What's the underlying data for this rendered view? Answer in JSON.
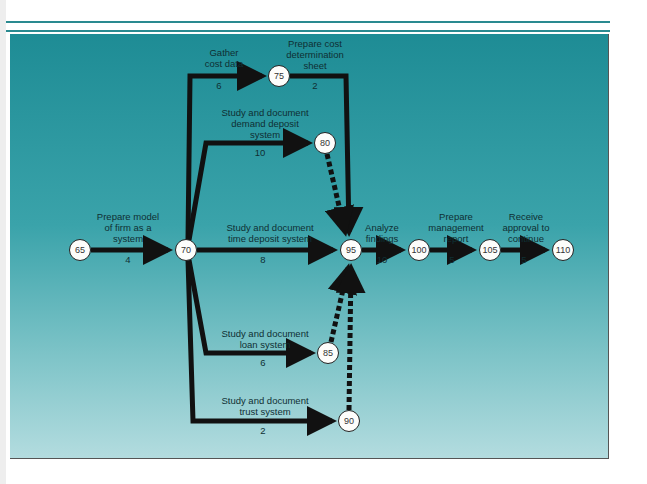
{
  "diagram": {
    "type": "pert-network",
    "colors": {
      "panel_top": "#1e8c95",
      "panel_bottom": "#b3dcdf",
      "arrow": "#111111",
      "node_fill": "#fdfdfb",
      "text": "#0f2f33"
    },
    "nodes": [
      {
        "id": "65",
        "label": "65"
      },
      {
        "id": "70",
        "label": "70"
      },
      {
        "id": "75",
        "label": "75"
      },
      {
        "id": "80",
        "label": "80"
      },
      {
        "id": "85",
        "label": "85"
      },
      {
        "id": "90",
        "label": "90"
      },
      {
        "id": "95",
        "label": "95"
      },
      {
        "id": "100",
        "label": "100"
      },
      {
        "id": "105",
        "label": "105"
      },
      {
        "id": "110",
        "label": "110"
      }
    ],
    "activities": [
      {
        "from": "65",
        "to": "70",
        "label": "Prepare model\nof firm as a\nsystem",
        "duration": "4",
        "style": "solid"
      },
      {
        "from": "70",
        "to": "75",
        "label": "Gather\ncost data",
        "duration": "6",
        "style": "solid"
      },
      {
        "from": "75",
        "to": "95",
        "label": "Prepare cost\ndetermination\nsheet",
        "duration": "2",
        "style": "solid"
      },
      {
        "from": "70",
        "to": "80",
        "label": "Study and document\ndemand deposit\nsystem",
        "duration": "10",
        "style": "solid"
      },
      {
        "from": "70",
        "to": "95",
        "label": "Study and document\ntime deposit system",
        "duration": "8",
        "style": "solid"
      },
      {
        "from": "70",
        "to": "85",
        "label": "Study and document\nloan system",
        "duration": "6",
        "style": "solid"
      },
      {
        "from": "70",
        "to": "90",
        "label": "Study and document\ntrust system",
        "duration": "2",
        "style": "solid"
      },
      {
        "from": "80",
        "to": "95",
        "label": "",
        "duration": "",
        "style": "dummy-dashed"
      },
      {
        "from": "85",
        "to": "95",
        "label": "",
        "duration": "",
        "style": "dummy-dashed"
      },
      {
        "from": "90",
        "to": "95",
        "label": "",
        "duration": "",
        "style": "dummy-dashed"
      },
      {
        "from": "95",
        "to": "100",
        "label": "Analyze\nfindings",
        "duration": "10",
        "style": "solid"
      },
      {
        "from": "100",
        "to": "105",
        "label": "Prepare\nmanagement\nreport",
        "duration": "5",
        "style": "solid"
      },
      {
        "from": "105",
        "to": "110",
        "label": "Receive\napproval to\ncontinue",
        "duration": "5",
        "style": "solid"
      }
    ]
  }
}
